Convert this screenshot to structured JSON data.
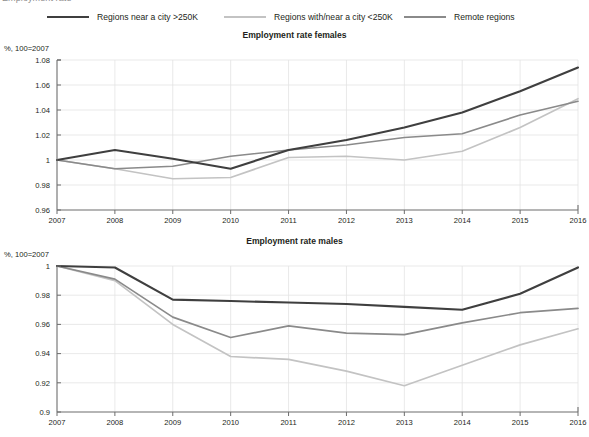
{
  "clipped_header": "Employment rate",
  "legend": {
    "items": [
      {
        "label": "Regions near a city >250K",
        "color": "#3f3f3f"
      },
      {
        "label": "Regions with/near a city <250K",
        "color": "#c3c3c3"
      },
      {
        "label": "Remote regions",
        "color": "#8a8a8a"
      }
    ]
  },
  "charts": [
    {
      "title": "Employment rate females",
      "ylabel": "%, 100=2007"
    },
    {
      "title": "Employment rate males",
      "ylabel": "%, 100=2007"
    }
  ],
  "chart_data": [
    {
      "type": "line",
      "title": "Employment rate females",
      "xlabel": "",
      "ylabel": "%, 100=2007",
      "x": [
        2007,
        2008,
        2009,
        2010,
        2011,
        2012,
        2013,
        2014,
        2015,
        2016
      ],
      "xticklabels": [
        "2007",
        "2008",
        "2009",
        "2010",
        "2011",
        "2012",
        "2013",
        "2014",
        "2015",
        "2016"
      ],
      "ylim": [
        0.96,
        1.08
      ],
      "yticks": [
        0.96,
        0.98,
        1,
        1.02,
        1.04,
        1.06,
        1.08
      ],
      "yticklabels": [
        "0.96",
        "0.98",
        "1",
        "1.02",
        "1.04",
        "1.06",
        "1.08"
      ],
      "grid": true,
      "legend_position": "top",
      "series": [
        {
          "name": "Regions near a city >250K",
          "color": "#3f3f3f",
          "values": [
            1.0,
            1.008,
            1.001,
            0.993,
            1.008,
            1.016,
            1.026,
            1.038,
            1.055,
            1.074
          ]
        },
        {
          "name": "Regions with/near a city <250K",
          "color": "#c3c3c3",
          "values": [
            1.0,
            0.993,
            0.985,
            0.986,
            1.002,
            1.003,
            1.0,
            1.007,
            1.026,
            1.049
          ]
        },
        {
          "name": "Remote regions",
          "color": "#8a8a8a",
          "values": [
            1.0,
            0.993,
            0.995,
            1.003,
            1.008,
            1.012,
            1.018,
            1.021,
            1.036,
            1.047
          ]
        }
      ]
    },
    {
      "type": "line",
      "title": "Employment rate males",
      "xlabel": "",
      "ylabel": "%, 100=2007",
      "x": [
        2007,
        2008,
        2009,
        2010,
        2011,
        2012,
        2013,
        2014,
        2015,
        2016
      ],
      "xticklabels": [
        "2007",
        "2008",
        "2009",
        "2010",
        "2011",
        "2012",
        "2013",
        "2014",
        "2015",
        "2016"
      ],
      "ylim": [
        0.9,
        1.0
      ],
      "yticks": [
        0.9,
        0.92,
        0.94,
        0.96,
        0.98,
        1
      ],
      "yticklabels": [
        "0.9",
        "0.92",
        "0.94",
        "0.96",
        "0.98",
        "1"
      ],
      "grid": true,
      "legend_position": "top",
      "series": [
        {
          "name": "Regions near a city >250K",
          "color": "#3f3f3f",
          "values": [
            1.0,
            0.999,
            0.977,
            0.976,
            0.975,
            0.974,
            0.972,
            0.97,
            0.981,
            0.999
          ]
        },
        {
          "name": "Regions with/near a city <250K",
          "color": "#c3c3c3",
          "values": [
            1.0,
            0.99,
            0.96,
            0.938,
            0.936,
            0.928,
            0.918,
            0.932,
            0.946,
            0.957
          ]
        },
        {
          "name": "Remote regions",
          "color": "#8a8a8a",
          "values": [
            1.0,
            0.991,
            0.965,
            0.951,
            0.959,
            0.954,
            0.953,
            0.961,
            0.968,
            0.971
          ]
        }
      ]
    }
  ]
}
